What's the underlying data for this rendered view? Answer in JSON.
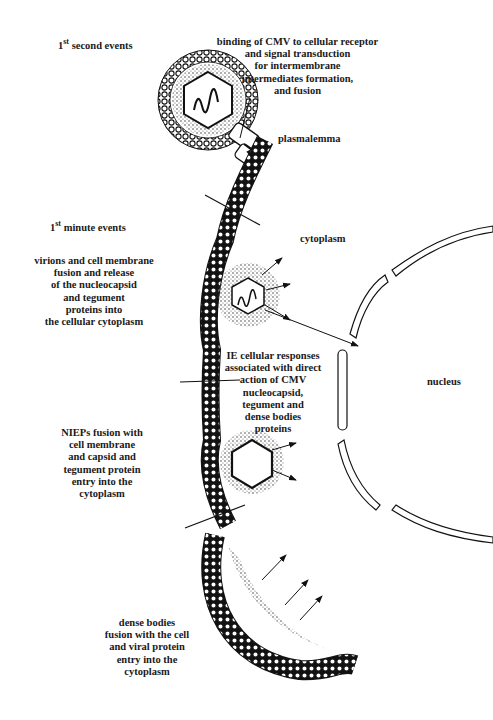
{
  "figure": {
    "headings": {
      "first_second": {
        "num": "1",
        "sup": "st",
        "text": " second events"
      },
      "first_minute": {
        "num": "1",
        "sup": "st",
        "text": " minute events"
      }
    },
    "labels": {
      "binding": "binding of CMV to cellular receptor\nand signal transduction\nfor intermembrane\nintermediates formation,\nand fusion",
      "plasmalemma": "plasmalemma",
      "cytoplasm": "cytoplasm",
      "virions_fusion": "virions and cell membrane\nfusion and release\nof the nucleocapsid\nand tegument\nproteins into\nthe cellular cytoplasm",
      "ie_responses": "IE cellular responses\nassociated with direct\naction of CMV\nnucleocapsid,\ntegument and\ndense bodies\nproteins",
      "nucleus": "nucleus",
      "niep_fusion": "NIEPs fusion with\ncell membrane\nand capsid and\ntegument protein\nentry into the\ncytoplasm",
      "dense_bodies": "dense bodies\nfusion with the cell\nand viral protein\nentry into the\ncytoplasm"
    }
  }
}
